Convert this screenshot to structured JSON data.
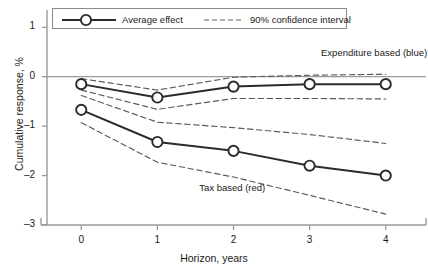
{
  "chart_data": {
    "type": "line",
    "title": "",
    "xlabel": "Horizon, years",
    "ylabel": "Cumulative response, %",
    "xlim": [
      -0.45,
      4.45
    ],
    "ylim": [
      -3,
      1.35
    ],
    "xticks": [
      0,
      1,
      2,
      3,
      4
    ],
    "yticks": [
      1,
      0,
      -1,
      -2,
      -3
    ],
    "xtick_labels": [
      "0",
      "1",
      "2",
      "3",
      "4"
    ],
    "ytick_labels": [
      "1",
      "0",
      "–1",
      "–2",
      "–3"
    ],
    "grid": false,
    "zero_line": 0,
    "legend_position": "top-left",
    "x": [
      0,
      1,
      2,
      3,
      4
    ],
    "series": [
      {
        "name": "Expenditure based (blue)",
        "role": "average-effect",
        "color": "#2b2b2b",
        "values": [
          -0.15,
          -0.42,
          -0.2,
          -0.15,
          -0.15
        ]
      },
      {
        "name": "Expenditure based (blue) 90% CI upper",
        "role": "confidence-upper",
        "color": "#5a5a5a",
        "values": [
          -0.04,
          -0.27,
          -0.01,
          0.03,
          0.05
        ]
      },
      {
        "name": "Expenditure based (blue) 90% CI lower",
        "role": "confidence-lower",
        "color": "#5a5a5a",
        "values": [
          -0.27,
          -0.66,
          -0.44,
          -0.44,
          -0.45
        ]
      },
      {
        "name": "Tax based (red)",
        "role": "average-effect",
        "color": "#2b2b2b",
        "values": [
          -0.67,
          -1.32,
          -1.5,
          -1.8,
          -2.0
        ]
      },
      {
        "name": "Tax based (red) 90% CI upper",
        "role": "confidence-upper",
        "color": "#5a5a5a",
        "values": [
          -0.38,
          -0.92,
          -1.03,
          -1.17,
          -1.35
        ]
      },
      {
        "name": "Tax based (red) 90% CI lower",
        "role": "confidence-lower",
        "color": "#5a5a5a",
        "values": [
          -0.93,
          -1.73,
          -2.03,
          -2.4,
          -2.78
        ]
      }
    ],
    "annotations": [
      {
        "text": "Expenditure based (blue)",
        "x": 3.15,
        "y": 0.45
      },
      {
        "text": "Tax based (red)",
        "x": 1.55,
        "y": -2.27
      }
    ],
    "legend": [
      {
        "label": "Average effect",
        "style": "solid-marker"
      },
      {
        "label": "90% confidence interval",
        "style": "dashed"
      }
    ]
  }
}
